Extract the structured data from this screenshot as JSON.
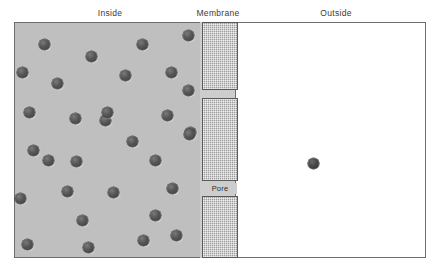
{
  "figure": {
    "title": "",
    "type": "diagram"
  },
  "labels": {
    "inside": "Inside",
    "membrane": "Membrane",
    "outside": "Outside",
    "pore": "Pore"
  },
  "colors": {
    "inside_fill": "#bfbfbf",
    "outside_fill": "#ffffff",
    "membrane_fill": "#9c9c9c",
    "membrane_border": "#5a5a5a",
    "frame_border": "#6e6e6e",
    "particle_fill": "#4a4a4a",
    "label_text": "#3a3a3a"
  },
  "regions": {
    "inside": {
      "x": 14,
      "y": 22,
      "width": 186,
      "height": 236
    },
    "outside": {
      "x": 235,
      "y": 22,
      "width": 191,
      "height": 236
    },
    "membrane_blocks": [
      {
        "x": 202,
        "y": 22,
        "width": 36,
        "height": 68
      },
      {
        "x": 202,
        "y": 98,
        "width": 36,
        "height": 83
      },
      {
        "x": 202,
        "y": 196,
        "width": 36,
        "height": 62
      }
    ],
    "pores": [
      {
        "x": 202,
        "y": 90,
        "width": 36,
        "height": 8
      },
      {
        "x": 202,
        "y": 181,
        "width": 36,
        "height": 15
      }
    ]
  },
  "counts": {
    "inside_particles": 31,
    "outside_particles": 1
  },
  "particles": {
    "inside": [
      {
        "x": 44,
        "y": 44
      },
      {
        "x": 91,
        "y": 56
      },
      {
        "x": 142,
        "y": 44
      },
      {
        "x": 188,
        "y": 35
      },
      {
        "x": 22,
        "y": 72
      },
      {
        "x": 57,
        "y": 83
      },
      {
        "x": 125,
        "y": 75
      },
      {
        "x": 171,
        "y": 72
      },
      {
        "x": 188,
        "y": 90
      },
      {
        "x": 29,
        "y": 112
      },
      {
        "x": 75,
        "y": 118
      },
      {
        "x": 105,
        "y": 120
      },
      {
        "x": 107,
        "y": 112
      },
      {
        "x": 167,
        "y": 115
      },
      {
        "x": 190,
        "y": 132
      },
      {
        "x": 33,
        "y": 150
      },
      {
        "x": 48,
        "y": 160
      },
      {
        "x": 76,
        "y": 161
      },
      {
        "x": 132,
        "y": 141
      },
      {
        "x": 189,
        "y": 134
      },
      {
        "x": 155,
        "y": 160
      },
      {
        "x": 20,
        "y": 198
      },
      {
        "x": 67,
        "y": 191
      },
      {
        "x": 113,
        "y": 192
      },
      {
        "x": 172,
        "y": 188
      },
      {
        "x": 82,
        "y": 220
      },
      {
        "x": 155,
        "y": 215
      },
      {
        "x": 27,
        "y": 244
      },
      {
        "x": 88,
        "y": 247
      },
      {
        "x": 143,
        "y": 240
      },
      {
        "x": 176,
        "y": 235
      }
    ],
    "outside": [
      {
        "x": 313,
        "y": 163
      }
    ]
  }
}
